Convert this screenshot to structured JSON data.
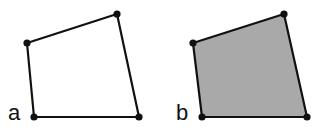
{
  "panels": [
    {
      "label": "a",
      "fill": "#ffffff",
      "stroke": "#111111",
      "vertices": [
        [
          27,
          43
        ],
        [
          117,
          14
        ],
        [
          139,
          117
        ],
        [
          34,
          117
        ]
      ],
      "label_pos": [
        8,
        120
      ]
    },
    {
      "label": "b",
      "fill": "#a9a9a9",
      "stroke": "#111111",
      "vertices": [
        [
          193,
          43
        ],
        [
          284,
          14
        ],
        [
          307,
          117
        ],
        [
          202,
          117
        ]
      ],
      "label_pos": [
        176,
        120
      ]
    }
  ]
}
